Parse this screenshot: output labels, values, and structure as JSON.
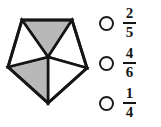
{
  "figure": {
    "name": "shaded-pentagon-fraction-diagram",
    "shape": "pentagon",
    "total_parts": 5,
    "shaded_parts": 2,
    "shaded_fraction": "2/5",
    "outline_color": "#161616",
    "shaded_fill": "#b8b8b8",
    "unshaded_fill": "#ffffff",
    "parts": [
      {
        "id": "top-triangle",
        "shaded": true
      },
      {
        "id": "right-triangle",
        "shaded": false
      },
      {
        "id": "bottom-right-triangle",
        "shaded": false
      },
      {
        "id": "bottom-left-triangle",
        "shaded": true
      },
      {
        "id": "left-triangle",
        "shaded": false
      }
    ]
  },
  "options": [
    {
      "id": "option-a",
      "numerator": "2",
      "denominator": "5",
      "selected": false
    },
    {
      "id": "option-b",
      "numerator": "4",
      "denominator": "6",
      "selected": false
    },
    {
      "id": "option-c",
      "numerator": "1",
      "denominator": "4",
      "selected": false
    }
  ]
}
